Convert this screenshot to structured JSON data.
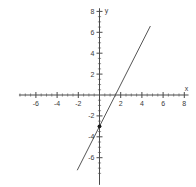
{
  "chart_data": {
    "type": "line",
    "title": "",
    "subtitle": "",
    "xlabel": "x",
    "ylabel": "y",
    "xlim": [
      -8,
      8
    ],
    "ylim": [
      -8,
      8
    ],
    "grid": false,
    "legend": null,
    "x_ticks": [
      -6,
      -4,
      -2,
      2,
      4,
      6,
      8
    ],
    "y_ticks": [
      2,
      4,
      6,
      8,
      -2,
      -4,
      -6
    ],
    "x_tick_labels": [
      "-6",
      "-4",
      "-2",
      "2",
      "4",
      "6",
      "8"
    ],
    "y_tick_labels": [
      "2",
      "4",
      "6",
      "8",
      "-2",
      "-4",
      "-6"
    ],
    "minor_tick_step": 0.5,
    "series": [
      {
        "name": "line",
        "equation": "y = 2x - 3",
        "slope": 2,
        "intercept": -3,
        "x": [
          -2.1,
          4.8
        ],
        "values": [
          -7.2,
          6.6
        ],
        "color": "#555555"
      }
    ],
    "points": [
      {
        "label": "y-intercept",
        "x": 0,
        "y": -3,
        "color": "#1a1a1a"
      }
    ],
    "x_intercept": 1.5
  },
  "axes": {
    "x_axis_label": "x",
    "y_axis_label": "y",
    "axis_color": "#4a4a4a"
  },
  "canvas": {
    "background": "#ffffff",
    "width": 196,
    "height": 187
  }
}
